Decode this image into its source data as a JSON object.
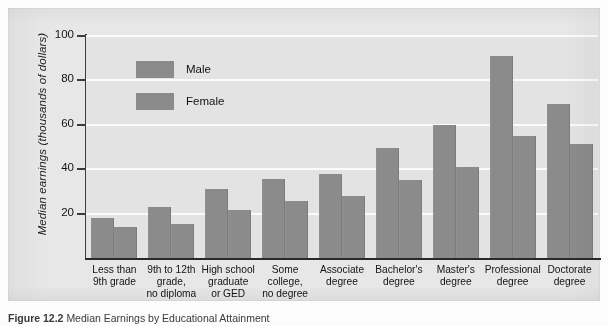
{
  "figure": {
    "caption_prefix": "Figure 12.2",
    "caption_text": "Median Earnings by Educational Attainment"
  },
  "chart_data": {
    "type": "bar",
    "title": "",
    "xlabel": "",
    "ylabel": "Median earnings (thousands of dollars)",
    "ylim": [
      0,
      100
    ],
    "yticks": [
      20,
      40,
      60,
      80,
      100
    ],
    "grid": true,
    "legend_position": "inside-top-left",
    "categories": [
      "Less than 9th grade",
      "9th to 12th grade, no diploma",
      "High school graduate or GED",
      "Some college, no degree",
      "Associate degree",
      "Bachelor's degree",
      "Master's degree",
      "Professional degree",
      "Doctorate degree"
    ],
    "category_lines": [
      [
        "Less than",
        "9th grade"
      ],
      [
        "9th to 12th",
        "grade,",
        "no diploma"
      ],
      [
        "High school",
        "graduate",
        "or GED"
      ],
      [
        "Some",
        "college,",
        "no degree"
      ],
      [
        "Associate",
        "degree"
      ],
      [
        "Bachelor's",
        "degree"
      ],
      [
        "Master's",
        "degree"
      ],
      [
        "Professional",
        "degree"
      ],
      [
        "Doctorate",
        "degree"
      ]
    ],
    "series": [
      {
        "name": "Male",
        "color": "#8b8b8b",
        "values": [
          18,
          23,
          31,
          35.5,
          38,
          49.5,
          60,
          91,
          69.5
        ]
      },
      {
        "name": "Female",
        "color": "#8b8b8b",
        "values": [
          14,
          15.5,
          21.5,
          25.5,
          28,
          35,
          41,
          55,
          51.5
        ]
      }
    ]
  },
  "colors": {
    "bar": "#8b8b8b",
    "plot_background": "#e3e3e3",
    "panel_background": "#e7e7e7",
    "gridline": "#fbfbfb",
    "axis": "#2a2a2a"
  }
}
